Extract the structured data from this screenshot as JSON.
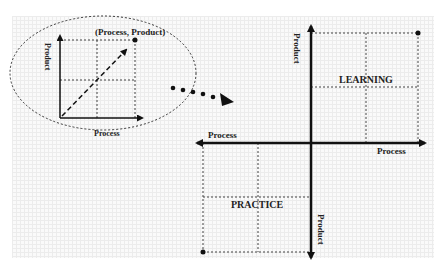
{
  "inset": {
    "point_label": "(Process, Product)",
    "x_axis_label": "Process",
    "y_axis_label": "Product"
  },
  "main": {
    "x_axis_right_label": "Process",
    "x_axis_left_label": "Process",
    "y_axis_top_label": "Product",
    "y_axis_bottom_label": "Product",
    "quadrant_top_right": "LEARNING",
    "quadrant_bottom_left": "PRACTICE"
  }
}
